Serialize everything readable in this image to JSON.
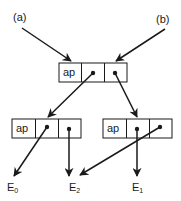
{
  "diagram": {
    "type": "pointer-node graph",
    "inputs": [
      {
        "id": "a",
        "label": "(a)"
      },
      {
        "id": "b",
        "label": "(b)"
      }
    ],
    "nodes": [
      {
        "id": "top",
        "cells": [
          "ap",
          "•",
          "•"
        ]
      },
      {
        "id": "left",
        "cells": [
          "ap",
          "•",
          "•"
        ]
      },
      {
        "id": "right",
        "cells": [
          "ap",
          "•",
          "•"
        ]
      }
    ],
    "leaves": [
      {
        "id": "E0",
        "base": "E",
        "sub": "0"
      },
      {
        "id": "E2",
        "base": "E",
        "sub": "2"
      },
      {
        "id": "E1",
        "base": "E",
        "sub": "1"
      }
    ],
    "edges": [
      {
        "from": "(a)",
        "to": "top"
      },
      {
        "from": "(b)",
        "to": "top"
      },
      {
        "from": "top.cell2",
        "to": "left"
      },
      {
        "from": "top.cell3",
        "to": "right"
      },
      {
        "from": "left.cell2",
        "to": "E0"
      },
      {
        "from": "left.cell3",
        "to": "E2"
      },
      {
        "from": "right.cell2",
        "to": "E1"
      },
      {
        "from": "right.cell3",
        "to": "E2"
      }
    ],
    "colors": {
      "stroke": "#1a1a1a",
      "background": "#ffffff"
    }
  }
}
